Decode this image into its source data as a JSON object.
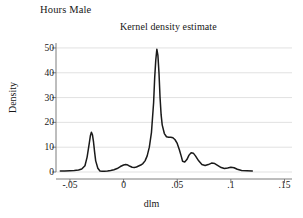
{
  "chart_data": {
    "type": "line",
    "title": "Hours Male",
    "subtitle": "Kernel density estimate",
    "xlabel": "dlm",
    "ylabel": "Density",
    "xlim": [
      -0.063,
      0.157
    ],
    "ylim": [
      0,
      52
    ],
    "xticks": [
      -0.05,
      0,
      0.05,
      0.1,
      0.15
    ],
    "xtick_labels": [
      "-.05",
      "0",
      ".05",
      ".1",
      ".15"
    ],
    "yticks": [
      0,
      10,
      20,
      30,
      40,
      50
    ],
    "ytick_labels": [
      "0",
      "10",
      "20",
      "30",
      "40",
      "50"
    ],
    "grid": "horizontal",
    "legend": "none",
    "line_color": "#1a1a1a",
    "grid_color": "#d9d9d9",
    "axis_color": "#6e6e6e",
    "background": "#ffffff",
    "series": [
      {
        "name": "Density",
        "x": [
          -0.059,
          -0.055,
          -0.05,
          -0.046,
          -0.042,
          -0.039,
          -0.036,
          -0.034,
          -0.032,
          -0.031,
          -0.03,
          -0.029,
          -0.028,
          -0.027,
          -0.026,
          -0.024,
          -0.022,
          -0.02,
          -0.018,
          -0.015,
          -0.012,
          -0.009,
          -0.006,
          -0.003,
          0.0,
          0.002,
          0.004,
          0.006,
          0.008,
          0.01,
          0.012,
          0.014,
          0.016,
          0.018,
          0.02,
          0.022,
          0.024,
          0.026,
          0.028,
          0.029,
          0.03,
          0.031,
          0.032,
          0.033,
          0.034,
          0.035,
          0.036,
          0.038,
          0.04,
          0.042,
          0.044,
          0.046,
          0.048,
          0.05,
          0.052,
          0.054,
          0.055,
          0.057,
          0.059,
          0.061,
          0.063,
          0.065,
          0.067,
          0.07,
          0.073,
          0.076,
          0.079,
          0.082,
          0.085,
          0.088,
          0.091,
          0.094,
          0.097,
          0.1,
          0.103,
          0.106,
          0.11,
          0.115,
          0.12
        ],
        "y": [
          0.4,
          0.4,
          0.5,
          0.6,
          0.8,
          1.2,
          2.5,
          6.0,
          11.5,
          14.5,
          16.0,
          15.0,
          12.0,
          8.0,
          4.5,
          1.5,
          0.4,
          0.3,
          0.3,
          0.4,
          0.6,
          0.9,
          1.4,
          2.2,
          2.8,
          3.0,
          2.8,
          2.3,
          1.9,
          1.8,
          2.0,
          2.4,
          2.8,
          3.4,
          4.5,
          6.5,
          10.0,
          16.0,
          28.0,
          38.0,
          45.0,
          49.5,
          47.0,
          40.0,
          30.0,
          23.0,
          19.0,
          15.5,
          14.2,
          14.0,
          14.0,
          13.8,
          13.0,
          11.5,
          9.0,
          6.0,
          4.3,
          4.0,
          5.0,
          6.8,
          7.8,
          7.6,
          6.5,
          4.5,
          3.0,
          2.6,
          3.0,
          3.6,
          3.4,
          2.6,
          1.8,
          1.4,
          1.6,
          1.9,
          1.7,
          1.1,
          0.6,
          0.5,
          0.4
        ]
      }
    ]
  }
}
